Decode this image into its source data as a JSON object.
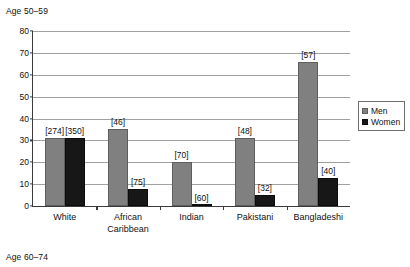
{
  "figure": {
    "caption_top": "Age 50–59",
    "caption_bottom": "Age 60–74"
  },
  "legend": {
    "position": "top-right",
    "entries": [
      {
        "label": "Men",
        "color": "#808080",
        "swatch": "men-swatch"
      },
      {
        "label": "Women",
        "color": "#171717",
        "swatch": "women-swatch"
      }
    ]
  },
  "colors": {
    "men": "#808080",
    "women": "#171717",
    "grid": "#a0a0a0",
    "axis": "#3a3a3a",
    "background": "#ffffff"
  },
  "chart_data": {
    "type": "bar",
    "title": "Age 50–59",
    "subtitle": "Age 60–74",
    "xlabel": "",
    "ylabel": "",
    "ylim": [
      0,
      80
    ],
    "yticks": [
      0,
      10,
      20,
      30,
      40,
      50,
      60,
      70,
      80
    ],
    "ytick_labels": [
      "0",
      "10",
      "20",
      "30",
      "40",
      "50",
      "60",
      "70",
      "80"
    ],
    "grid": true,
    "legend_position": "top right",
    "categories": [
      "White",
      "African Caribbean",
      "Indian",
      "Pakistani",
      "Bangladeshi"
    ],
    "category_lines": [
      [
        "White"
      ],
      [
        "African",
        "Caribbean"
      ],
      [
        "Indian"
      ],
      [
        "Pakistani"
      ],
      [
        "Bangladeshi"
      ]
    ],
    "series": [
      {
        "name": "Men",
        "color": "#808080",
        "values": [
          31,
          35,
          20,
          31,
          66
        ],
        "annotations": [
          "[274]",
          "[46]",
          "[70]",
          "[48]",
          "[57]"
        ]
      },
      {
        "name": "Women",
        "color": "#171717",
        "values": [
          31,
          8,
          0.5,
          5,
          13
        ],
        "annotations": [
          "[350]",
          "[75]",
          "[60]",
          "[32]",
          "[40]"
        ]
      }
    ]
  }
}
